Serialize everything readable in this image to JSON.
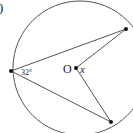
{
  "diagram": {
    "part_label": ")",
    "angle_label": "32°",
    "center_label": "O",
    "unknown_label": "x",
    "colors": {
      "stroke": "#555555",
      "point": "#111111",
      "text": "#222222"
    }
  }
}
